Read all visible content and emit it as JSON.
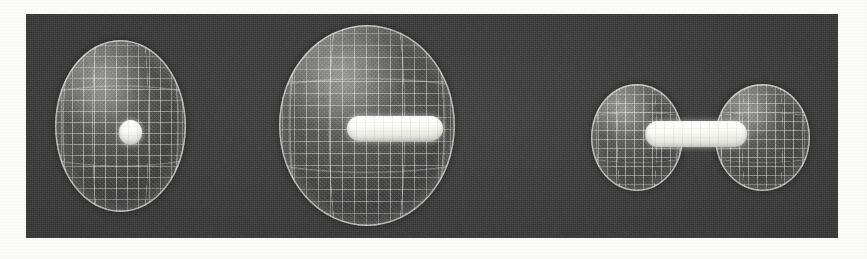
{
  "figure": {
    "description": "Three computer-rendered views of translucent wireframe mesh surfaces enclosing solid white inner cores, shown side by side on a dark rendering panel.",
    "panel_background_color": "#3a3a3a",
    "paper_background_color": "#fbfbf9",
    "mesh_line_color": "#ecece6",
    "core_color": "#ffffff",
    "panel": {
      "x": 26,
      "y": 14,
      "width": 812,
      "height": 224
    },
    "object_count": 3
  },
  "objects": [
    {
      "id": "object-1",
      "name": "sphere-with-point-core",
      "label": "Spherical mesh envelope with central point core",
      "shell": {
        "shape": "sphere",
        "center_x": 120,
        "center_y": 126,
        "width": 131,
        "height": 172,
        "mesh_u": "11px",
        "mesh_v": "11px"
      },
      "core": {
        "shape": "sphere",
        "center_x": 130,
        "center_y": 132,
        "width": 23,
        "height": 25
      }
    },
    {
      "id": "object-2",
      "name": "ellipsoid-with-capsule-core",
      "label": "Large ovoid mesh envelope with horizontal capsule core",
      "shell": {
        "shape": "ellipsoid",
        "center_x": 367,
        "center_y": 125,
        "width": 176,
        "height": 201,
        "mesh_u": "12px",
        "mesh_v": "12px"
      },
      "core": {
        "shape": "capsule",
        "center_x": 395,
        "center_y": 128,
        "width": 96,
        "height": 25
      }
    },
    {
      "id": "object-3",
      "name": "two-lobe-pair-with-bond-rod",
      "label": "Two separated mesh lobes joined by a solid capsule bond rod",
      "lobes": [
        {
          "id": "object-3-lobe-left",
          "name": "left-lobe",
          "shape": "sphere",
          "center_x": 637,
          "center_y": 137,
          "width": 92,
          "height": 107,
          "mesh_u": "9px",
          "mesh_v": "9px"
        },
        {
          "id": "object-3-lobe-right",
          "name": "right-lobe",
          "shape": "sphere",
          "center_x": 762,
          "center_y": 137,
          "width": 95,
          "height": 107,
          "mesh_u": "9px",
          "mesh_v": "9px"
        }
      ],
      "core": {
        "shape": "capsule",
        "center_x": 696,
        "center_y": 134,
        "width": 101,
        "height": 26,
        "occluded_segment": {
          "x": 645,
          "y": 121,
          "width": 31,
          "height": 26
        }
      }
    }
  ]
}
